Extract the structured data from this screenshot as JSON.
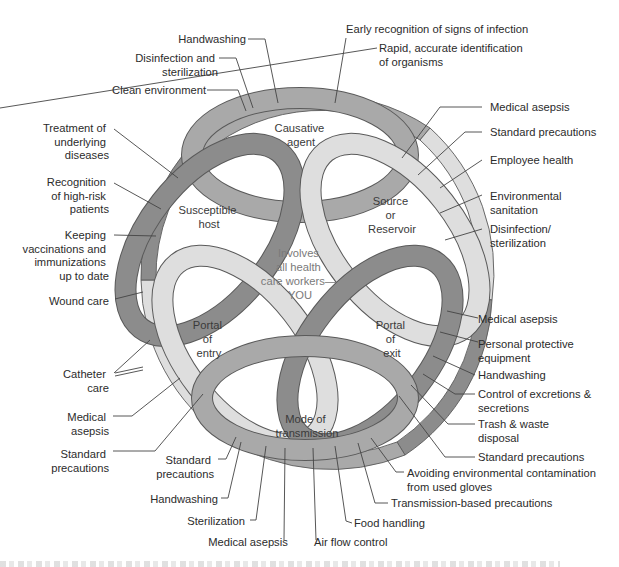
{
  "diagram": {
    "colors": {
      "ring_medium": "#a9a9a9",
      "ring_dark": "#8c8c8c",
      "ring_light": "#dedede",
      "outline": "#5a5a5a",
      "text": "#2b2b2b",
      "center_text": "#7a7a7a"
    },
    "links": [
      {
        "id": "causative-agent",
        "label_lines": [
          "Causative",
          "agent"
        ],
        "shade": "medium"
      },
      {
        "id": "source-reservoir",
        "label_lines": [
          "Source",
          "or",
          "Reservoir"
        ],
        "shade": "light"
      },
      {
        "id": "portal-of-exit",
        "label_lines": [
          "Portal",
          "of",
          "exit"
        ],
        "shade": "dark"
      },
      {
        "id": "mode-of-transmission",
        "label_lines": [
          "Mode of",
          "transmission"
        ],
        "shade": "medium"
      },
      {
        "id": "portal-of-entry",
        "label_lines": [
          "Portal",
          "of",
          "entry"
        ],
        "shade": "light"
      },
      {
        "id": "susceptible-host",
        "label_lines": [
          "Susceptible",
          "host"
        ],
        "shade": "dark"
      }
    ],
    "center_lines": [
      "Involves",
      "all health",
      "care workers—",
      "YOU"
    ],
    "interventions": {
      "causative_agent": [
        {
          "lines": [
            "Handwashing"
          ]
        },
        {
          "lines": [
            "Disinfection and",
            "sterilization"
          ]
        },
        {
          "lines": [
            "Clean environment"
          ]
        },
        {
          "lines": [
            "Early recognition of signs of infection"
          ]
        },
        {
          "lines": [
            "Rapid, accurate identification",
            "of organisms"
          ]
        }
      ],
      "source_reservoir": [
        {
          "lines": [
            "Medical asepsis"
          ]
        },
        {
          "lines": [
            "Standard precautions"
          ]
        },
        {
          "lines": [
            "Employee health"
          ]
        },
        {
          "lines": [
            "Environmental",
            "sanitation"
          ]
        },
        {
          "lines": [
            "Disinfection/",
            "sterilization"
          ]
        }
      ],
      "portal_of_exit": [
        {
          "lines": [
            "Medical asepsis"
          ]
        },
        {
          "lines": [
            "Personal protective",
            "equipment"
          ]
        },
        {
          "lines": [
            "Handwashing"
          ]
        },
        {
          "lines": [
            "Control of excretions &",
            "secretions"
          ]
        },
        {
          "lines": [
            "Trash & waste",
            "disposal"
          ]
        },
        {
          "lines": [
            "Standard precautions"
          ]
        }
      ],
      "mode_of_transmission": [
        {
          "lines": [
            "Avoiding environmental contamination",
            "from used gloves"
          ]
        },
        {
          "lines": [
            "Transmission-based precautions"
          ]
        },
        {
          "lines": [
            "Food handling"
          ]
        },
        {
          "lines": [
            "Air flow control"
          ]
        },
        {
          "lines": [
            "Medical asepsis"
          ]
        },
        {
          "lines": [
            "Sterilization"
          ]
        },
        {
          "lines": [
            "Handwashing"
          ]
        },
        {
          "lines": [
            "Standard",
            "precautions"
          ]
        }
      ],
      "portal_of_entry": [
        {
          "lines": [
            "Wound care"
          ]
        },
        {
          "lines": [
            "Catheter",
            "care"
          ]
        },
        {
          "lines": [
            "Medical",
            "asepsis"
          ]
        },
        {
          "lines": [
            "Standard",
            "precautions"
          ]
        }
      ],
      "susceptible_host": [
        {
          "lines": [
            "Treatment of",
            "underlying",
            "diseases"
          ]
        },
        {
          "lines": [
            "Recognition",
            "of high-risk",
            "patients"
          ]
        },
        {
          "lines": [
            "Keeping",
            "vaccinations and",
            "immunizations",
            "up to date"
          ]
        }
      ]
    }
  }
}
